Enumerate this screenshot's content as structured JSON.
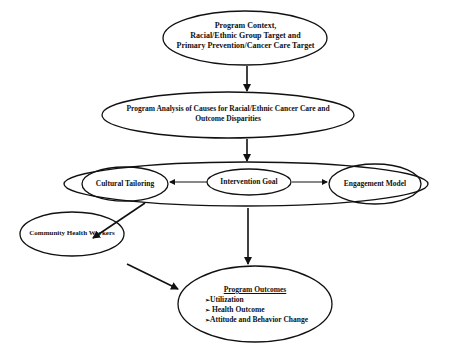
{
  "diagram": {
    "nodes": {
      "context": {
        "lines": [
          "Program Context,",
          "Racial/Ethnic Group Target and",
          "Primary Prevention/Cancer Care Target"
        ]
      },
      "analysis": {
        "lines": [
          "Program Analysis of Causes for Racial/Ethnic Cancer Care and",
          "Outcome Disparities"
        ]
      },
      "cultural_tailoring": {
        "label": "Cultural Tailoring"
      },
      "intervention_goal": {
        "label": "Intervention Goal"
      },
      "engagement_model": {
        "label": "Engagement Model"
      },
      "chw": {
        "label": "Community Health Workers"
      },
      "outcomes": {
        "title": "Program Outcomes",
        "items": [
          "Utilization",
          " Health Outcome",
          "Attitude and Behavior Change"
        ]
      }
    },
    "edges": [
      {
        "from": "context",
        "to": "analysis"
      },
      {
        "from": "analysis",
        "to": "intervention_group"
      },
      {
        "from": "intervention_goal",
        "to": "cultural_tailoring"
      },
      {
        "from": "intervention_goal",
        "to": "engagement_model"
      },
      {
        "from": "intervention_group",
        "to": "chw"
      },
      {
        "from": "intervention_group",
        "to": "outcomes"
      },
      {
        "from": "chw",
        "to": "outcomes"
      }
    ],
    "colors": {
      "stroke": "#111111",
      "background": "#ffffff"
    }
  }
}
